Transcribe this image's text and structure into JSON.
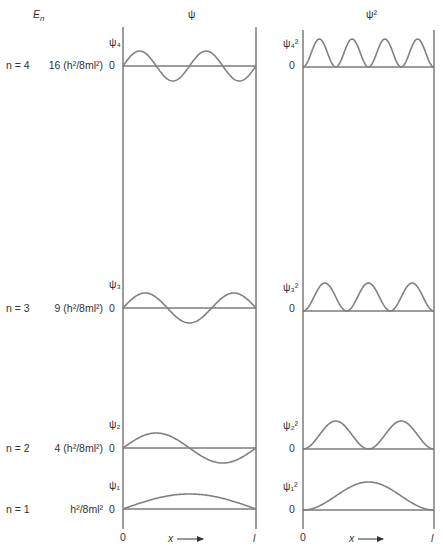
{
  "header": {
    "energy_label": "E",
    "energy_subscript": "n",
    "psi_title": "ψ",
    "psi_sq_title": "ψ²"
  },
  "panels": {
    "psi": {
      "x0": 123,
      "x1": 256,
      "top": 27,
      "bottom": 529
    },
    "psi_sq": {
      "x0": 303,
      "x1": 434,
      "top": 30,
      "bottom": 529
    }
  },
  "levels": [
    {
      "n_label": "n = 4",
      "energy_label": "16 (h²/8ml²)",
      "psi_label": "ψ₄",
      "psi_sq_label": "ψ₄²",
      "zero": "0",
      "n": 4,
      "baseline_psi": 66,
      "baseline_sq": 67,
      "amp_psi": 15,
      "amp_sq": 28,
      "label_y": 69
    },
    {
      "n_label": "n = 3",
      "energy_label": "9 (h²/8ml²)",
      "psi_label": "ψ₃",
      "psi_sq_label": "ψ₃²",
      "zero": "0",
      "n": 3,
      "baseline_psi": 308,
      "baseline_sq": 311,
      "amp_psi": 15,
      "amp_sq": 28,
      "label_y": 312
    },
    {
      "n_label": "n = 2",
      "energy_label": "4 (h²/8ml²)",
      "psi_label": "ψ₂",
      "psi_sq_label": "ψ₂²",
      "zero": "0",
      "n": 2,
      "baseline_psi": 448,
      "baseline_sq": 449,
      "amp_psi": 15,
      "amp_sq": 28,
      "label_y": 452
    },
    {
      "n_label": "n = 1",
      "energy_label": "h²/8ml²",
      "psi_label": "ψ₁",
      "psi_sq_label": "ψ₁²",
      "zero": "0",
      "n": 1,
      "baseline_psi": 509,
      "baseline_sq": 510,
      "amp_psi": 15,
      "amp_sq": 28,
      "label_y": 513
    }
  ],
  "x_axis": {
    "origin_label": "0",
    "end_label": "l",
    "variable_label": "x"
  },
  "colors": {
    "axis": "#3a3a3a",
    "wave": "#808080",
    "text": "#333333"
  }
}
